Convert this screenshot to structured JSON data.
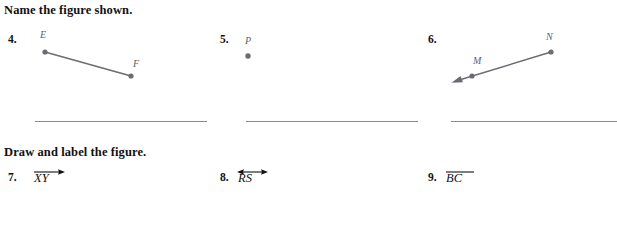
{
  "page": {
    "background_color": "#ffffff",
    "ink_color": "#111111",
    "figure_color": "#6b6b73",
    "rule_color": "#8a8a92"
  },
  "sections": [
    {
      "id": "name-the-figure",
      "heading": "Name the figure shown."
    },
    {
      "id": "draw-and-label",
      "heading": "Draw and label the figure."
    }
  ],
  "name_problems": [
    {
      "number": "4.",
      "figure_type": "segment",
      "labels": [
        "E",
        "F"
      ],
      "answer_line": true
    },
    {
      "number": "5.",
      "figure_type": "point",
      "labels": [
        "P"
      ],
      "answer_line": true
    },
    {
      "number": "6.",
      "figure_type": "ray",
      "labels": [
        "M",
        "N"
      ],
      "answer_line": true
    }
  ],
  "draw_problems": [
    {
      "number": "7.",
      "notation_letters": "XY",
      "notation_type": "ray",
      "spoken": "ray XY"
    },
    {
      "number": "8.",
      "notation_letters": "RS",
      "notation_type": "line",
      "spoken": "line RS"
    },
    {
      "number": "9.",
      "notation_letters": "BC",
      "notation_type": "segment",
      "spoken": "segment BC"
    }
  ]
}
